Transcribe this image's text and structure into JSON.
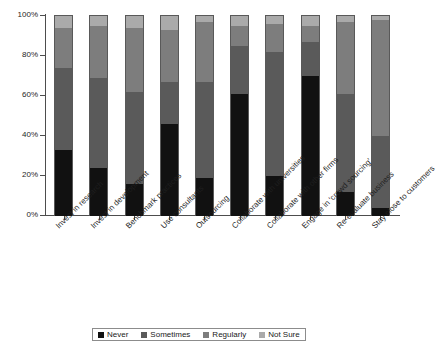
{
  "chart_data": {
    "type": "bar",
    "stacked": true,
    "normalized_percent": true,
    "title": "",
    "xlabel": "",
    "ylabel": "",
    "ylim": [
      0,
      100
    ],
    "ytick_labels": [
      "0%",
      "20%",
      "40%",
      "60%",
      "80%",
      "100%"
    ],
    "ytick_values": [
      0,
      20,
      40,
      60,
      80,
      100
    ],
    "grid": false,
    "legend_position": "bottom",
    "categories": [
      "Invest in research",
      "Invest in development",
      "Benchmark practices",
      "Use consultants",
      "Outsourcing",
      "Collaborate with universities",
      "Collaborate with other firms",
      "Engage in 'crowd sourcing'",
      "Re-evaluate business",
      "Stay close to customers"
    ],
    "series": [
      {
        "name": "Never",
        "color": "#111111",
        "values": [
          33,
          24,
          16,
          46,
          19,
          61,
          20,
          70,
          12,
          4
        ]
      },
      {
        "name": "Sometimes",
        "color": "#5a5a5a",
        "values": [
          41,
          45,
          46,
          21,
          48,
          24,
          62,
          17,
          49,
          36
        ]
      },
      {
        "name": "Regularly",
        "color": "#7d7d7d",
        "values": [
          20,
          26,
          32,
          26,
          30,
          10,
          14,
          8,
          36,
          58
        ]
      },
      {
        "name": "Not Sure",
        "color": "#aaaaaa",
        "values": [
          6,
          5,
          6,
          7,
          3,
          5,
          4,
          5,
          3,
          2
        ]
      }
    ]
  },
  "legend": {
    "items": [
      {
        "label": "Never",
        "color": "#111111"
      },
      {
        "label": "Sometimes",
        "color": "#5a5a5a"
      },
      {
        "label": "Regularly",
        "color": "#7d7d7d"
      },
      {
        "label": "Not Sure",
        "color": "#aaaaaa"
      }
    ]
  }
}
